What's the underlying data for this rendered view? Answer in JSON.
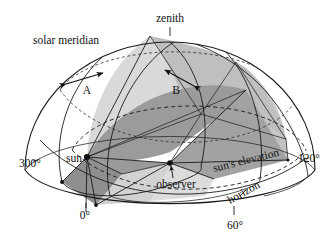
{
  "figure": {
    "type": "astronomical-diagram",
    "background_color": "#ffffff",
    "line_color": "#1a1a1a"
  },
  "labels": {
    "zenith": "zenith",
    "solar_meridian": "solar meridian",
    "arrow_a": "A",
    "arrow_b": "B",
    "sun": "sun",
    "observer": "observer",
    "suns_elevation": "sun's elevation",
    "horizon": "horizon",
    "azimuth_300": "300°",
    "azimuth_120": "120°",
    "azimuth_0": "0°",
    "azimuth_60": "60°"
  },
  "colors": {
    "shade_light": "#d9d9d9",
    "shade_medium": "#c3c3c3",
    "shade_dark": "#9b9b9b",
    "shade_darker": "#8f8f8f",
    "stroke": "#1a1a1a",
    "text": "#111111"
  },
  "geometry": {
    "dome_center_x": 170,
    "dome_center_y": 170,
    "dome_radius_x": 145,
    "dome_radius_y": 128,
    "sun_point": [
      87,
      157
    ],
    "observer_point": [
      170,
      163
    ],
    "zenith_point": [
      170,
      27
    ]
  },
  "azimuth_ticks": [
    {
      "label": "300°",
      "value": 300
    },
    {
      "label": "0°",
      "value": 0
    },
    {
      "label": "60°",
      "value": 60
    },
    {
      "label": "120°",
      "value": 120
    }
  ]
}
